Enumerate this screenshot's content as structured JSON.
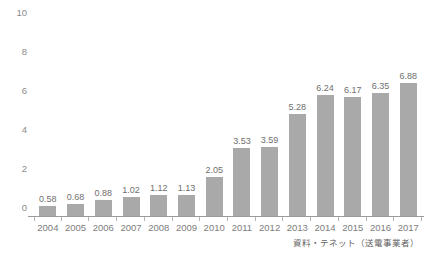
{
  "chart_data": {
    "type": "bar",
    "title": "",
    "xlabel": "",
    "ylabel": "",
    "ylim": [
      0,
      10
    ],
    "yticks": [
      0,
      2,
      4,
      6,
      8,
      10
    ],
    "ytick_labels": [
      "0",
      "2",
      "4",
      "6",
      "8",
      "10"
    ],
    "grid": false,
    "legend": null,
    "bar_color": "#a9a9a9",
    "categories": [
      "2004",
      "2005",
      "2006",
      "2007",
      "2008",
      "2009",
      "2010",
      "2011",
      "2012",
      "2013",
      "2014",
      "2015",
      "2016",
      "2017"
    ],
    "values": [
      0.58,
      0.68,
      0.88,
      1.02,
      1.12,
      1.13,
      2.05,
      3.53,
      3.59,
      5.28,
      6.24,
      6.17,
      6.35,
      6.88
    ],
    "value_labels": [
      "0.58",
      "0.68",
      "0.88",
      "1.02",
      "1.12",
      "1.13",
      "2.05",
      "3.53",
      "3.59",
      "5.28",
      "6.24",
      "6.17",
      "6.35",
      "6.88"
    ],
    "annotations": [
      "資料・テネット（送電事業者）"
    ]
  },
  "header": {
    "title": ""
  },
  "footer": {
    "source_note": "資料・テネット（送電事業者）"
  }
}
